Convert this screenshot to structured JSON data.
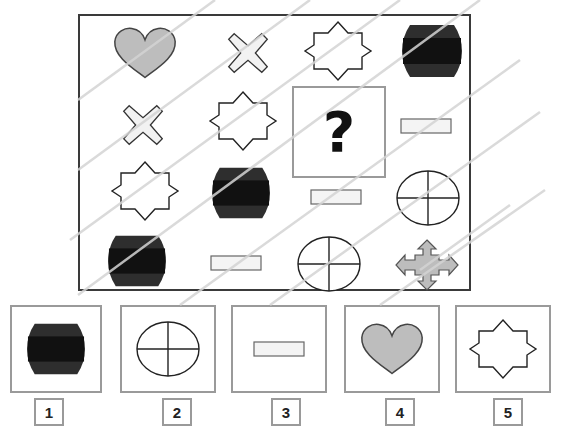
{
  "puzzle": {
    "question_mark": "?",
    "grid": [
      [
        "heart",
        "cross",
        "eight-point-star",
        "dark-barrel"
      ],
      [
        "cross",
        "eight-point-star",
        "missing",
        "rectangle"
      ],
      [
        "eight-point-star",
        "dark-barrel",
        "rectangle",
        "circle-quartered"
      ],
      [
        "dark-barrel",
        "rectangle",
        "circle-quartered",
        "four-arrow"
      ]
    ],
    "colors": {
      "frame": "#3a3a3a",
      "heart_fill": "#bdbdbd",
      "cross_fill": "#f2f2f2",
      "barrel_dark": "#1a1a1a",
      "barrel_mid": "#3a3a3a",
      "arrow_fill": "#bdbdbd",
      "rect_fill": "#f4f4f4",
      "option_border": "#9a9a9a",
      "diagonal_lines": "#d4d4d4"
    }
  },
  "options": [
    {
      "number": "1",
      "shape": "dark-barrel"
    },
    {
      "number": "2",
      "shape": "circle-quartered"
    },
    {
      "number": "3",
      "shape": "rectangle"
    },
    {
      "number": "4",
      "shape": "heart"
    },
    {
      "number": "5",
      "shape": "eight-point-star"
    }
  ]
}
